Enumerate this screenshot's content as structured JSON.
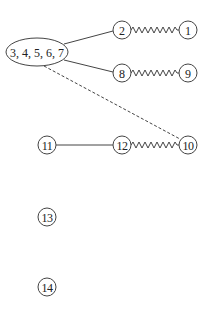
{
  "diagram": {
    "type": "graph",
    "nodes": [
      {
        "id": "g",
        "label": "3, 4, 5, 6, 7",
        "shape": "ellipse",
        "x": 37,
        "y": 52,
        "rx": 31,
        "ry": 14
      },
      {
        "id": "n2",
        "label": "2",
        "shape": "circle",
        "x": 122,
        "y": 30
      },
      {
        "id": "n1",
        "label": "1",
        "shape": "circle",
        "x": 188,
        "y": 30
      },
      {
        "id": "n8",
        "label": "8",
        "shape": "circle",
        "x": 122,
        "y": 73
      },
      {
        "id": "n9",
        "label": "9",
        "shape": "circle",
        "x": 188,
        "y": 73
      },
      {
        "id": "n11",
        "label": "11",
        "shape": "circle",
        "x": 47,
        "y": 145
      },
      {
        "id": "n12",
        "label": "12",
        "shape": "circle",
        "x": 122,
        "y": 145
      },
      {
        "id": "n10",
        "label": "10",
        "shape": "circle",
        "x": 188,
        "y": 145
      },
      {
        "id": "n13",
        "label": "13",
        "shape": "circle",
        "x": 47,
        "y": 217
      },
      {
        "id": "n14",
        "label": "14",
        "shape": "circle",
        "x": 47,
        "y": 287
      }
    ],
    "edges": [
      {
        "from": "g",
        "to": "n2",
        "style": "solid"
      },
      {
        "from": "g",
        "to": "n8",
        "style": "solid"
      },
      {
        "from": "n2",
        "to": "n1",
        "style": "zigzag"
      },
      {
        "from": "n8",
        "to": "n9",
        "style": "zigzag"
      },
      {
        "from": "n11",
        "to": "n12",
        "style": "solid"
      },
      {
        "from": "n12",
        "to": "n10",
        "style": "zigzag"
      },
      {
        "from": "g",
        "to": "n10",
        "style": "dashed"
      }
    ],
    "colors": {
      "stroke": "#444444",
      "text": "#222222",
      "background": "#ffffff"
    }
  }
}
